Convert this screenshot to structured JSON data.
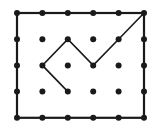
{
  "diagram": {
    "type": "dot-grid-path",
    "columns": 6,
    "rows": 5,
    "border": {
      "from": [
        0,
        0
      ],
      "to": [
        5,
        4
      ]
    },
    "path": [
      [
        5,
        0
      ],
      [
        4,
        1
      ],
      [
        3,
        2
      ],
      [
        2,
        1
      ],
      [
        1,
        2
      ],
      [
        2,
        3
      ]
    ],
    "colors": {
      "ink": "#1a1a1a",
      "background": "#ffffff"
    }
  }
}
